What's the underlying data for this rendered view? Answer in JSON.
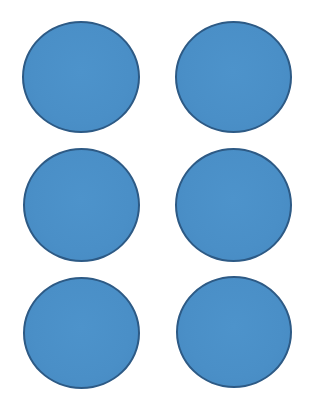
{
  "page": {
    "background": "#ffffff"
  },
  "style": {
    "fill_color": "#4a8fc7",
    "border_color": "#2d5a85"
  },
  "circles": [
    {
      "row": 1,
      "col": 1,
      "left": 22,
      "top": 21,
      "width": 118,
      "height": 112
    },
    {
      "row": 1,
      "col": 2,
      "left": 175,
      "top": 21,
      "width": 117,
      "height": 112
    },
    {
      "row": 2,
      "col": 1,
      "left": 23,
      "top": 148,
      "width": 117,
      "height": 114
    },
    {
      "row": 2,
      "col": 2,
      "left": 175,
      "top": 148,
      "width": 117,
      "height": 114
    },
    {
      "row": 3,
      "col": 1,
      "left": 23,
      "top": 277,
      "width": 117,
      "height": 112
    },
    {
      "row": 3,
      "col": 2,
      "left": 176,
      "top": 276,
      "width": 116,
      "height": 112
    }
  ]
}
